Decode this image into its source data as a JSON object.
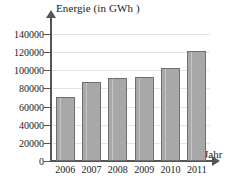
{
  "chart_data": {
    "type": "bar",
    "title": "",
    "xlabel": "Jahr",
    "ylabel": "Energie (in GWh )",
    "categories": [
      "2006",
      "2007",
      "2008",
      "2009",
      "2010",
      "2011"
    ],
    "values": [
      71000,
      87000,
      92000,
      93000,
      103000,
      121000
    ],
    "ylim": [
      0,
      150000
    ],
    "yticks": [
      0,
      20000,
      40000,
      60000,
      80000,
      100000,
      120000,
      140000
    ],
    "ytick_labels": [
      "0",
      "20000",
      "40000",
      "60000",
      "80000",
      "100000",
      "120000",
      "140000"
    ],
    "grid": true,
    "legend": false,
    "bar_color": "#a8a8a8",
    "bar_border_color": "#6e6e6e",
    "axis_color": "#555555",
    "grid_color": "#e4e4e4",
    "text_color": "#1a1a1a"
  }
}
